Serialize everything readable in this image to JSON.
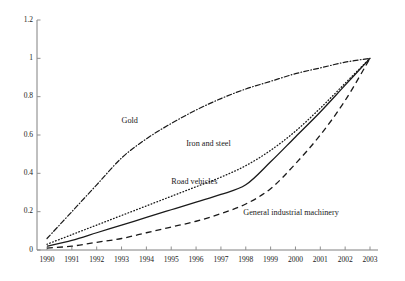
{
  "chart_data": {
    "type": "line",
    "title": "",
    "subtitle": "",
    "xlabel": "",
    "ylabel": "",
    "grid": false,
    "legend_position": "inline-annotations",
    "xlim": [
      1990,
      2003
    ],
    "ylim": [
      0,
      1.2
    ],
    "y_ticks": [
      "0",
      "0.2",
      "0.4",
      "0.6",
      "0.8",
      "1",
      "1.2"
    ],
    "y_tick_values": [
      0,
      0.2,
      0.4,
      0.6,
      0.8,
      1.0,
      1.2
    ],
    "categories": [
      "1990",
      "1991",
      "1992",
      "1993",
      "1994",
      "1995",
      "1996",
      "1997",
      "1998",
      "1999",
      "2000",
      "2001",
      "2002",
      "2003"
    ],
    "x": [
      1990,
      1991,
      1992,
      1993,
      1994,
      1995,
      1996,
      1997,
      1998,
      1999,
      2000,
      2001,
      2002,
      2003
    ],
    "series": [
      {
        "name": "Gold",
        "style": "dash-dot",
        "color": "#1a1a1a",
        "values": [
          0.06,
          0.2,
          0.34,
          0.48,
          0.58,
          0.66,
          0.73,
          0.79,
          0.84,
          0.88,
          0.92,
          0.95,
          0.98,
          1.0
        ]
      },
      {
        "name": "Iron and steel",
        "style": "dotted",
        "color": "#1a1a1a",
        "values": [
          0.03,
          0.08,
          0.13,
          0.18,
          0.23,
          0.28,
          0.33,
          0.38,
          0.44,
          0.52,
          0.62,
          0.74,
          0.87,
          1.0
        ]
      },
      {
        "name": "Road vehicles",
        "style": "solid",
        "color": "#1a1a1a",
        "values": [
          0.02,
          0.05,
          0.09,
          0.13,
          0.17,
          0.21,
          0.25,
          0.29,
          0.34,
          0.46,
          0.59,
          0.72,
          0.86,
          1.0
        ]
      },
      {
        "name": "General industrial machinery",
        "style": "dashed",
        "color": "#1a1a1a",
        "values": [
          0.01,
          0.02,
          0.04,
          0.06,
          0.09,
          0.12,
          0.15,
          0.19,
          0.24,
          0.32,
          0.45,
          0.6,
          0.78,
          1.0
        ]
      }
    ],
    "annotations": [
      {
        "text": "Gold",
        "x": 1993.0,
        "y": 0.665
      },
      {
        "text": "Iron and steel",
        "x": 1995.6,
        "y": 0.545
      },
      {
        "text": "Road vehicles",
        "x": 1995.0,
        "y": 0.345
      },
      {
        "text": "General industrial machinery",
        "x": 1997.9,
        "y": 0.185
      }
    ]
  }
}
